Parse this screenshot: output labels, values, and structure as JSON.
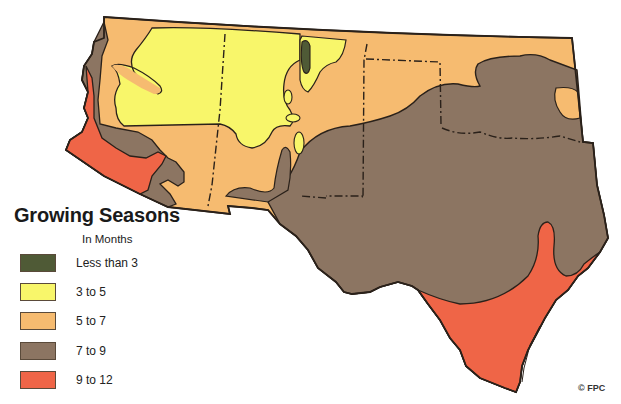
{
  "map": {
    "title": "Growing Seasons",
    "subtitle": "In Months",
    "region": "Southwestern United States (California edge, Nevada/Utah/Colorado south, Arizona, New Mexico, Oklahoma, Texas)",
    "colors": {
      "less_than_3": "#4f5a36",
      "3_to_5": "#f8f66a",
      "5_to_7": "#f6bb70",
      "7_to_9": "#8c7562",
      "9_to_12": "#ef6547",
      "outline": "#2a211a"
    }
  },
  "legend": {
    "title": "Growing Seasons",
    "subtitle": "In Months",
    "items": [
      {
        "label": "Less than 3",
        "color": "#4f5a36"
      },
      {
        "label": "3 to 5",
        "color": "#f8f66a"
      },
      {
        "label": "5 to 7",
        "color": "#f6bb70"
      },
      {
        "label": "7 to 9",
        "color": "#8c7562"
      },
      {
        "label": "9 to 12",
        "color": "#ef6547"
      }
    ]
  },
  "credit": "© FPC"
}
